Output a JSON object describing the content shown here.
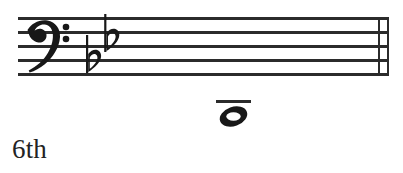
{
  "staff": {
    "clef": "bass-clef",
    "clef_glyph": "𝄢",
    "line_count": 5,
    "line_color": "#2b2b2b",
    "key_signature": {
      "accidental_type": "flat",
      "accidental_glyph": "♭",
      "count": 2,
      "accidentals": [
        {
          "name": "b-flat",
          "pitch": "Bb"
        },
        {
          "name": "e-flat",
          "pitch": "Eb"
        }
      ],
      "key_name": "B-flat major"
    },
    "barline": {
      "type": "double-barline",
      "stroke_count": 2
    }
  },
  "notes": [
    {
      "name": "whole-note",
      "glyph": "𝇢",
      "duration": "whole",
      "ledger_lines_above": 1,
      "position": "below-staff"
    }
  ],
  "caption": {
    "text": "6th",
    "color": "#232323"
  },
  "colors": {
    "ink": "#232323",
    "staff_line": "#2b2b2b",
    "background": "#ffffff"
  }
}
